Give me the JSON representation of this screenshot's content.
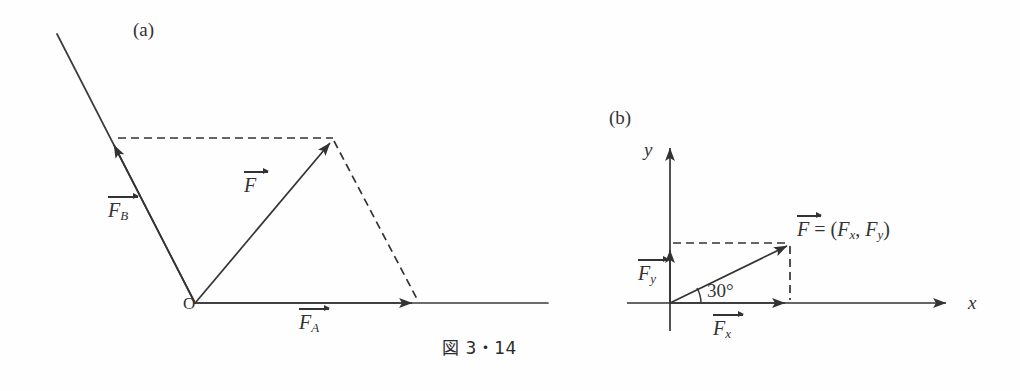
{
  "figure": {
    "caption": "図 3・14",
    "background": "#fefefe",
    "stroke_color": "#333333"
  },
  "panel_a": {
    "tag": "(a)",
    "origin_label": "O",
    "vectors": [
      {
        "name": "F_B",
        "base": "F",
        "sub": "B",
        "label_x": 108,
        "label_y": 196
      },
      {
        "name": "F",
        "base": "F",
        "sub": "",
        "label_x": 243,
        "label_y": 171
      },
      {
        "name": "F_A",
        "base": "F",
        "sub": "A",
        "label_x": 297,
        "label_y": 307
      }
    ],
    "geometry": {
      "origin": [
        195,
        303
      ],
      "fb_tip": [
        113,
        139
      ],
      "fb_line_far": [
        57,
        34
      ],
      "f_tip": [
        333,
        139
      ],
      "fa_tip": [
        417,
        303
      ],
      "x_axis_end": [
        548,
        303
      ],
      "dashed_top": [
        [
          113,
          138
        ],
        [
          333,
          138
        ]
      ],
      "dashed_right": [
        [
          333,
          140
        ],
        [
          417,
          300
        ]
      ]
    }
  },
  "panel_b": {
    "tag": "(b)",
    "x_axis_label": "x",
    "y_axis_label": "y",
    "angle_label": "30°",
    "resultant_label": {
      "prefix": "F",
      "equals": " = (",
      "comp_x": "F",
      "comp_x_sub": "x",
      "separator": ",  ",
      "comp_y": "F",
      "comp_y_sub": "y",
      "close": ")"
    },
    "vectors": [
      {
        "name": "F_y",
        "base": "F",
        "sub": "y",
        "label_x": 638,
        "label_y": 258
      },
      {
        "name": "F_x",
        "base": "F",
        "sub": "x",
        "label_x": 713,
        "label_y": 313
      }
    ],
    "geometry": {
      "origin": [
        670,
        303
      ],
      "x_axis_start": [
        627,
        303
      ],
      "x_axis_end": [
        952,
        303
      ],
      "y_axis_bottom": [
        670,
        330
      ],
      "y_axis_top": [
        670,
        142
      ],
      "f_tip": [
        790,
        243
      ],
      "fy_tip": [
        670,
        245
      ],
      "fx_tip": [
        790,
        303
      ],
      "dashed_top": [
        [
          672,
          243
        ],
        [
          790,
          243
        ]
      ],
      "dashed_right": [
        [
          790,
          245
        ],
        [
          790,
          301
        ]
      ],
      "angle_arc_radius": 30
    }
  },
  "caption_pos": {
    "x": 440,
    "y": 348
  }
}
